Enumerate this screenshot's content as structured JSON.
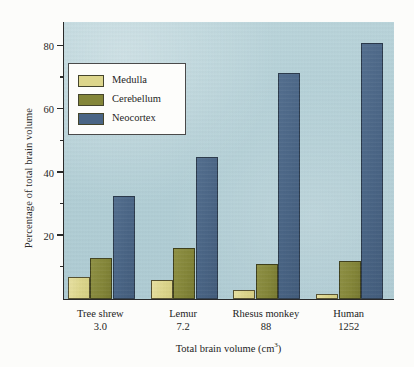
{
  "chart_data": {
    "type": "bar",
    "title": "",
    "xlabel": "Total brain volume (cm3)",
    "xlabel_prefix": "Total brain volume (cm",
    "xlabel_sup": "3",
    "xlabel_suffix": ")",
    "ylabel": "Percentage of total brain volume",
    "categories": [
      "Tree shrew",
      "Lemur",
      "Rhesus monkey",
      "Human"
    ],
    "category_values": [
      "3.0",
      "7.2",
      "88",
      "1252"
    ],
    "series": [
      {
        "name": "Medulla",
        "color": "#ddd68c",
        "values": [
          7,
          6,
          3,
          1.5
        ]
      },
      {
        "name": "Cerebellum",
        "color": "#848639",
        "values": [
          13,
          16,
          11,
          12
        ]
      },
      {
        "name": "Neocortex",
        "color": "#4a6585",
        "values": [
          32.5,
          45,
          71.5,
          81
        ]
      }
    ],
    "ylim": [
      0,
      88
    ],
    "yticks": [
      20,
      40,
      60,
      80
    ],
    "ytick_labels": [
      "20",
      "40",
      "60",
      "80"
    ],
    "yticks_minor": [
      10,
      30,
      50,
      70
    ],
    "grid": false,
    "legend_position": "upper-left",
    "plot_background": "#b2cfd6"
  },
  "legend": {
    "items": [
      {
        "label": "Medulla"
      },
      {
        "label": "Cerebellum"
      },
      {
        "label": "Neocortex"
      }
    ]
  }
}
